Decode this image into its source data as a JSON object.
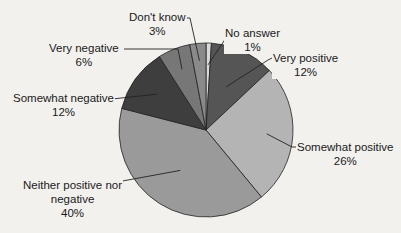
{
  "chart_data": {
    "type": "pie",
    "title": "",
    "start_angle_deg": 0,
    "direction": "clockwise",
    "slices": [
      {
        "label": "No answer",
        "value": 1,
        "pct_label": "1%",
        "color": "#d9d9d9"
      },
      {
        "label": "Very positive",
        "value": 12,
        "pct_label": "12%",
        "color": "#555555"
      },
      {
        "label": "Somewhat positive",
        "value": 26,
        "pct_label": "26%",
        "color": "#b4b4b4"
      },
      {
        "label": "Neither positive nor negative",
        "value": 40,
        "pct_label": "40%",
        "color": "#9a9a9a"
      },
      {
        "label": "Somewhat negative",
        "value": 12,
        "pct_label": "12%",
        "color": "#3e3e3e"
      },
      {
        "label": "Very negative",
        "value": 6,
        "pct_label": "6%",
        "color": "#777777"
      },
      {
        "label": "Don't know",
        "value": 3,
        "pct_label": "3%",
        "color": "#8a8a8a"
      }
    ]
  },
  "labels": {
    "no_answer": {
      "name": "No answer",
      "pct": "1%"
    },
    "very_positive": {
      "name": "Very positive",
      "pct": "12%"
    },
    "somewhat_positive": {
      "name": "Somewhat positive",
      "pct": "26%"
    },
    "neither": {
      "name1": "Neither positive nor",
      "name2": "negative",
      "pct": "40%"
    },
    "somewhat_negative": {
      "name": "Somewhat negative",
      "pct": "12%"
    },
    "very_negative": {
      "name": "Very negative",
      "pct": "6%"
    },
    "dont_know": {
      "name": "Don't know",
      "pct": "3%"
    }
  }
}
